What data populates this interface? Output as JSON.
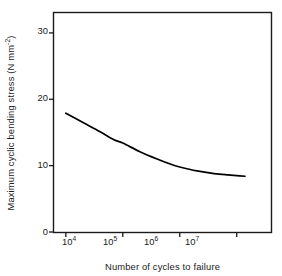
{
  "chart_data": {
    "type": "line",
    "title": "",
    "xlabel": "Number of cycles to failure",
    "ylabel": "Maximum cyclic bending stress (N mm⁻²)",
    "ylabel_parts": {
      "main": "Maximum cyclic bending stress (N mm",
      "exponent": "-2",
      "tail": ")"
    },
    "xscale": "log",
    "yscale": "linear",
    "xlim": [
      6200,
      40000000
    ],
    "ylim": [
      0,
      33
    ],
    "grid": false,
    "legend": "none",
    "xticks": [
      {
        "value": 10000,
        "label": "10",
        "exponent": "4"
      },
      {
        "value": 100000,
        "label": "10",
        "exponent": "5"
      },
      {
        "value": 1000000,
        "label": "10",
        "exponent": "6"
      },
      {
        "value": 10000000,
        "label": "10",
        "exponent": "7"
      }
    ],
    "yticks": [
      {
        "value": 0,
        "label": "0"
      },
      {
        "value": 10,
        "label": "10"
      },
      {
        "value": 20,
        "label": "20"
      },
      {
        "value": 30,
        "label": "30"
      }
    ],
    "series": [
      {
        "name": "S-N fatigue curve",
        "color": "#000000",
        "x": [
          10000,
          20000,
          40000,
          70000,
          100000,
          200000,
          400000,
          700000,
          1000000,
          2000000,
          4000000,
          7000000,
          10000000,
          14000000
        ],
        "values": [
          17.9,
          16.5,
          15.1,
          13.9,
          13.4,
          12.1,
          11.0,
          10.2,
          9.8,
          9.2,
          8.8,
          8.6,
          8.5,
          8.4
        ]
      }
    ]
  },
  "axes": {
    "frame_color": "#1a1a1a",
    "tick_direction": "out",
    "spines": "left-bottom-top-right"
  }
}
